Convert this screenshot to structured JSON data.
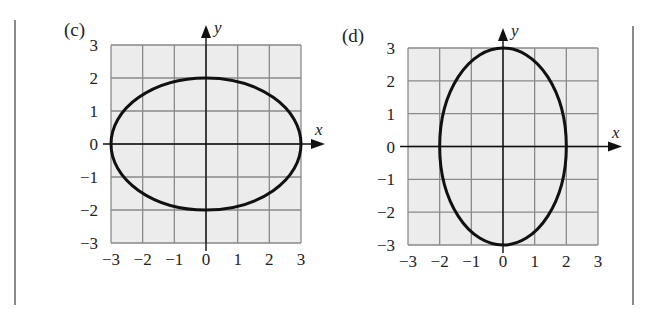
{
  "chart_data": [
    {
      "type": "line",
      "panel_label": "(c)",
      "title": "",
      "xlabel": "x",
      "ylabel": "y",
      "xlim": [
        -3,
        3
      ],
      "ylim": [
        -3,
        3
      ],
      "grid": true,
      "xticks": [
        "−3",
        "−2",
        "−1",
        "0",
        "1",
        "2",
        "3"
      ],
      "yticks": [
        "3",
        "2",
        "1",
        "0",
        "−1",
        "−2",
        "−3"
      ],
      "series": [
        {
          "name": "ellipse",
          "shape": "ellipse",
          "center": [
            0,
            0
          ],
          "semi_axis_x": 3,
          "semi_axis_y": 2,
          "equation": "x^2/9 + y^2/4 = 1"
        }
      ]
    },
    {
      "type": "line",
      "panel_label": "(d)",
      "title": "",
      "xlabel": "x",
      "ylabel": "y",
      "xlim": [
        -3,
        3
      ],
      "ylim": [
        -3,
        3
      ],
      "grid": true,
      "xticks": [
        "−3",
        "−2",
        "−1",
        "0",
        "1",
        "2",
        "3"
      ],
      "yticks": [
        "3",
        "2",
        "1",
        "0",
        "−1",
        "−2",
        "−3"
      ],
      "series": [
        {
          "name": "ellipse",
          "shape": "ellipse",
          "center": [
            0,
            0
          ],
          "semi_axis_x": 2,
          "semi_axis_y": 3,
          "equation": "x^2/4 + y^2/9 = 1"
        }
      ]
    }
  ],
  "colors": {
    "plot_fill": "#ececec",
    "grid_line": "#8a8a8a",
    "curve": "#111111",
    "axis": "#111111",
    "divider": "#8a8a8a"
  }
}
